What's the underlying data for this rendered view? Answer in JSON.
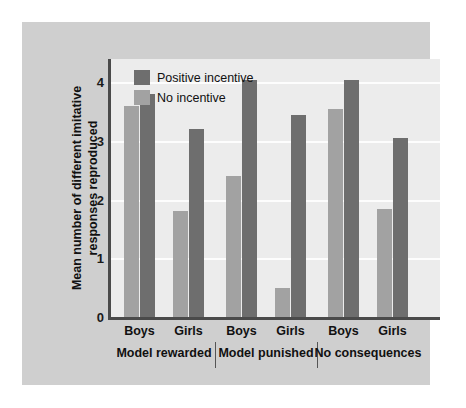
{
  "chart_data": {
    "type": "bar",
    "title": "",
    "xlabel": "",
    "ylabel": "Mean number of different imitative responses reproduced",
    "ylim": [
      0,
      4.4
    ],
    "yticks": [
      0,
      1,
      2,
      3,
      4
    ],
    "ytick_labels": [
      "0",
      "1",
      "2",
      "3",
      "4"
    ],
    "grid": true,
    "legend_position": "top-left",
    "categories": [
      "Boys",
      "Girls",
      "Boys",
      "Girls",
      "Boys",
      "Girls"
    ],
    "groups": [
      {
        "label": "Model rewarded",
        "subgroups": [
          {
            "label": "Boys",
            "bars": [
              {
                "series": "No incentive",
                "value": 3.6
              },
              {
                "series": "Positive incentive",
                "value": 3.8
              }
            ]
          },
          {
            "label": "Girls",
            "bars": [
              {
                "series": "No incentive",
                "value": 1.8
              },
              {
                "series": "Positive incentive",
                "value": 3.2
              }
            ]
          }
        ]
      },
      {
        "label": "Model punished",
        "subgroups": [
          {
            "label": "Boys",
            "bars": [
              {
                "series": "No incentive",
                "value": 2.4
              },
              {
                "series": "Positive incentive",
                "value": 4.05
              }
            ]
          },
          {
            "label": "Girls",
            "bars": [
              {
                "series": "No incentive",
                "value": 0.5
              },
              {
                "series": "Positive incentive",
                "value": 3.45
              }
            ]
          }
        ]
      },
      {
        "label": "No consequences",
        "subgroups": [
          {
            "label": "Boys",
            "bars": [
              {
                "series": "No incentive",
                "value": 3.55
              },
              {
                "series": "Positive incentive",
                "value": 4.05
              }
            ]
          },
          {
            "label": "Girls",
            "bars": [
              {
                "series": "No incentive",
                "value": 1.85
              },
              {
                "series": "Positive incentive",
                "value": 3.05
              }
            ]
          }
        ]
      }
    ],
    "series": [
      {
        "name": "Positive incentive",
        "color": "#6e6e6e",
        "values": [
          3.8,
          3.2,
          4.05,
          3.45,
          4.05,
          3.05
        ]
      },
      {
        "name": "No incentive",
        "color": "#a2a2a2",
        "values": [
          3.6,
          1.8,
          2.4,
          0.5,
          3.55,
          1.85
        ]
      }
    ]
  },
  "legend": {
    "items": [
      {
        "label": "Positive incentive",
        "swatch": "dark"
      },
      {
        "label": "No incentive",
        "swatch": "light"
      }
    ]
  },
  "colors": {
    "bar_dark": "#6e6e6e",
    "bar_light": "#a2a2a2",
    "panel_background": "#cfcfcf",
    "plot_background": "#ececec",
    "axis": "#4a4a4a",
    "gridline": "#fdfdfd",
    "text": "#111111"
  }
}
